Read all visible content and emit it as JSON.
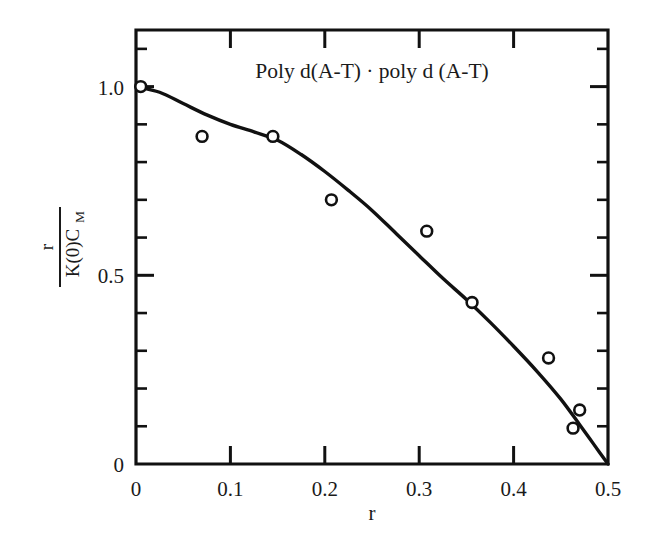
{
  "figure": {
    "title": "Poly d(A-T) · poly d (A-T)",
    "background_color": "#ffffff",
    "ink_color": "#111111"
  },
  "axes": {
    "x_label": "r",
    "y_label_numerator": "r",
    "y_label_denominator": "K(0)C",
    "y_label_denominator_subscript": "M",
    "x_tick_labels": [
      "0",
      "0.1",
      "0.2",
      "0.3",
      "0.4",
      "0.5"
    ],
    "y_tick_labels": [
      "0",
      "0.5",
      "1.0"
    ]
  },
  "chart_data": {
    "type": "scatter",
    "title": "Poly d(A-T) · poly d (A-T)",
    "xlabel": "r",
    "ylabel": "r / K(0)C_M",
    "xlim": [
      0,
      0.5
    ],
    "ylim": [
      0,
      1.15
    ],
    "grid": false,
    "legend": "none",
    "x_major_ticks": [
      0,
      0.1,
      0.2,
      0.3,
      0.4,
      0.5
    ],
    "x_minor_ticks": [
      0.05,
      0.15,
      0.25,
      0.35,
      0.45
    ],
    "y_major_ticks": [
      0,
      0.5,
      1.0
    ],
    "y_minor_ticks": [
      0.1,
      0.2,
      0.3,
      0.4,
      0.6,
      0.7,
      0.8,
      0.9,
      1.1
    ],
    "series": [
      {
        "name": "measured points",
        "marker": "open-circle",
        "points": [
          {
            "x": 0.005,
            "y": 1.0
          },
          {
            "x": 0.07,
            "y": 0.868
          },
          {
            "x": 0.145,
            "y": 0.868
          },
          {
            "x": 0.207,
            "y": 0.7
          },
          {
            "x": 0.308,
            "y": 0.617
          },
          {
            "x": 0.356,
            "y": 0.428
          },
          {
            "x": 0.437,
            "y": 0.281
          },
          {
            "x": 0.47,
            "y": 0.143
          },
          {
            "x": 0.463,
            "y": 0.095
          }
        ]
      },
      {
        "name": "theoretical fit curve",
        "marker": "none",
        "points": [
          {
            "x": 0.0,
            "y": 1.0
          },
          {
            "x": 0.025,
            "y": 0.985
          },
          {
            "x": 0.05,
            "y": 0.955
          },
          {
            "x": 0.075,
            "y": 0.925
          },
          {
            "x": 0.1,
            "y": 0.9
          },
          {
            "x": 0.125,
            "y": 0.88
          },
          {
            "x": 0.15,
            "y": 0.858
          },
          {
            "x": 0.175,
            "y": 0.82
          },
          {
            "x": 0.2,
            "y": 0.775
          },
          {
            "x": 0.225,
            "y": 0.725
          },
          {
            "x": 0.25,
            "y": 0.672
          },
          {
            "x": 0.275,
            "y": 0.612
          },
          {
            "x": 0.3,
            "y": 0.552
          },
          {
            "x": 0.325,
            "y": 0.492
          },
          {
            "x": 0.35,
            "y": 0.436
          },
          {
            "x": 0.375,
            "y": 0.376
          },
          {
            "x": 0.4,
            "y": 0.312
          },
          {
            "x": 0.425,
            "y": 0.245
          },
          {
            "x": 0.45,
            "y": 0.172
          },
          {
            "x": 0.47,
            "y": 0.104
          },
          {
            "x": 0.485,
            "y": 0.052
          },
          {
            "x": 0.5,
            "y": 0.0
          }
        ]
      }
    ]
  }
}
